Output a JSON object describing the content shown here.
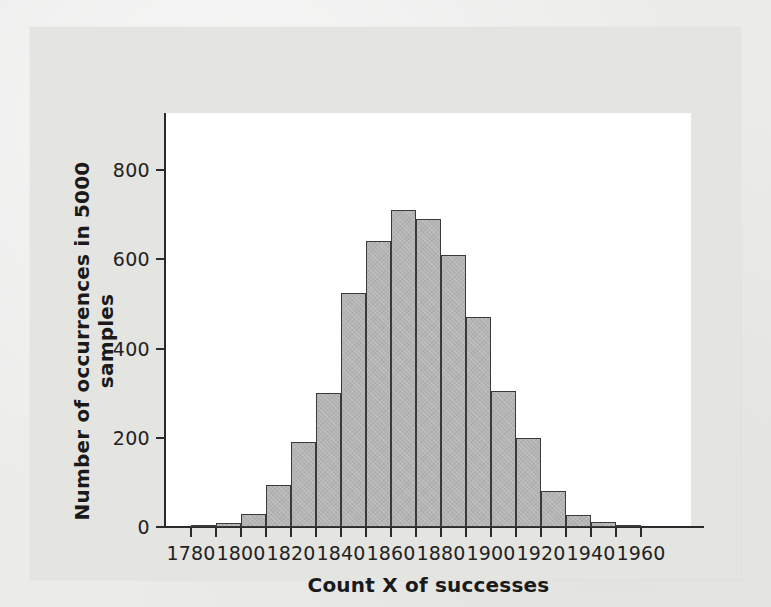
{
  "figure": {
    "background_color": "#ececeb",
    "mat_color": "#e4e4e1",
    "plot_background": "#ffffff",
    "bar_fill_color": "#b4b4b4",
    "bar_edge_color": "#3a3a3a",
    "axis_color": "#2a2a2a"
  },
  "chart_data": {
    "type": "bar",
    "title": "",
    "subtitle": "",
    "xlabel": "Count X of successes",
    "ylabel": "Number of occurrences in 5000 samples",
    "xlim": [
      1770,
      1980
    ],
    "ylim": [
      0,
      900
    ],
    "grid": false,
    "legend": null,
    "bin_width": 10,
    "x_tick_labels": [
      "1780",
      "1800",
      "1820",
      "1840",
      "1860",
      "1880",
      "1900",
      "1920",
      "1940",
      "1960"
    ],
    "x_tick_values": [
      1780,
      1800,
      1820,
      1840,
      1860,
      1880,
      1900,
      1920,
      1940,
      1960
    ],
    "x_minor_tick_values": [
      1790,
      1810,
      1830,
      1850,
      1870,
      1890,
      1910,
      1930,
      1950
    ],
    "y_tick_labels": [
      "0",
      "200",
      "400",
      "600",
      "800"
    ],
    "y_tick_values": [
      0,
      200,
      400,
      600,
      800
    ],
    "bins": [
      {
        "start": 1780,
        "end": 1790,
        "center": 1785,
        "value": 5
      },
      {
        "start": 1790,
        "end": 1800,
        "center": 1795,
        "value": 10
      },
      {
        "start": 1800,
        "end": 1810,
        "center": 1805,
        "value": 30
      },
      {
        "start": 1810,
        "end": 1820,
        "center": 1815,
        "value": 95
      },
      {
        "start": 1820,
        "end": 1830,
        "center": 1825,
        "value": 190
      },
      {
        "start": 1830,
        "end": 1840,
        "center": 1835,
        "value": 300
      },
      {
        "start": 1840,
        "end": 1850,
        "center": 1845,
        "value": 525
      },
      {
        "start": 1850,
        "end": 1860,
        "center": 1855,
        "value": 640
      },
      {
        "start": 1860,
        "end": 1870,
        "center": 1865,
        "value": 710
      },
      {
        "start": 1870,
        "end": 1880,
        "center": 1875,
        "value": 690
      },
      {
        "start": 1880,
        "end": 1890,
        "center": 1885,
        "value": 610
      },
      {
        "start": 1890,
        "end": 1900,
        "center": 1895,
        "value": 470
      },
      {
        "start": 1900,
        "end": 1910,
        "center": 1905,
        "value": 305
      },
      {
        "start": 1910,
        "end": 1920,
        "center": 1915,
        "value": 200
      },
      {
        "start": 1920,
        "end": 1930,
        "center": 1925,
        "value": 80
      },
      {
        "start": 1930,
        "end": 1940,
        "center": 1935,
        "value": 28
      },
      {
        "start": 1940,
        "end": 1950,
        "center": 1945,
        "value": 12
      },
      {
        "start": 1950,
        "end": 1960,
        "center": 1955,
        "value": 3
      }
    ],
    "categories": [
      1785,
      1795,
      1805,
      1815,
      1825,
      1835,
      1845,
      1855,
      1865,
      1875,
      1885,
      1895,
      1905,
      1915,
      1925,
      1935,
      1945,
      1955
    ],
    "values": [
      5,
      10,
      30,
      95,
      190,
      300,
      525,
      640,
      710,
      690,
      610,
      470,
      305,
      200,
      80,
      28,
      12,
      3
    ]
  }
}
